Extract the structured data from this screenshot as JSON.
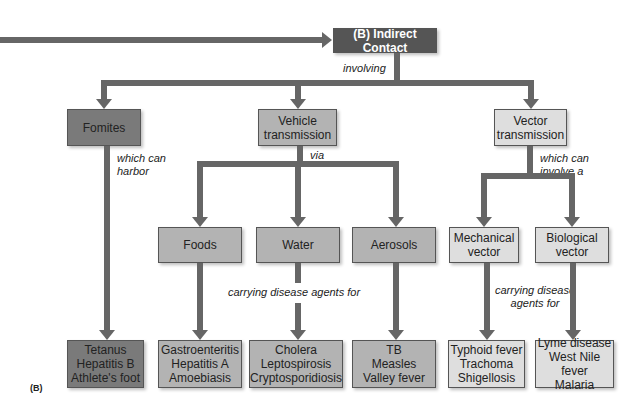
{
  "title": "(B) Indirect Contact",
  "caption": "(B)",
  "colors": {
    "connector": "#666666",
    "root_box": "#555555",
    "fomites_box": "#7a7a7a",
    "vehicle_box": "#b3b3b3",
    "vector_box": "#dedede"
  },
  "labels": {
    "involving": "involving",
    "which_can_harbor": "which can\nharbor",
    "via": "via",
    "which_can_involve_a": "which can\ninvolve a",
    "carrying_vehicle": "carrying disease agents for",
    "carrying_vector": "carrying disease\nagents for"
  },
  "level1": [
    {
      "id": "fomites",
      "label": "Fomites"
    },
    {
      "id": "vehicle",
      "label": "Vehicle\ntransmission"
    },
    {
      "id": "vector",
      "label": "Vector\ntransmission"
    }
  ],
  "level2": [
    {
      "id": "foods",
      "label": "Foods"
    },
    {
      "id": "water",
      "label": "Water"
    },
    {
      "id": "aerosols",
      "label": "Aerosols"
    },
    {
      "id": "mechanical",
      "label": "Mechanical\nvector"
    },
    {
      "id": "biological",
      "label": "Biological\nvector"
    }
  ],
  "diseases": [
    {
      "id": "fomites-diseases",
      "label": "Tetanus\nHepatitis B\nAthlete's foot"
    },
    {
      "id": "foods-diseases",
      "label": "Gastroenteritis\nHepatitis A\nAmoebiasis"
    },
    {
      "id": "water-diseases",
      "label": "Cholera\nLeptospirosis\nCryptosporidiosis"
    },
    {
      "id": "aerosols-diseases",
      "label": "TB\nMeasles\nValley fever"
    },
    {
      "id": "mechanical-diseases",
      "label": "Typhoid fever\nTrachoma\nShigellosis"
    },
    {
      "id": "biological-diseases",
      "label": "Lyme disease\nWest Nile fever\nMalaria"
    }
  ]
}
